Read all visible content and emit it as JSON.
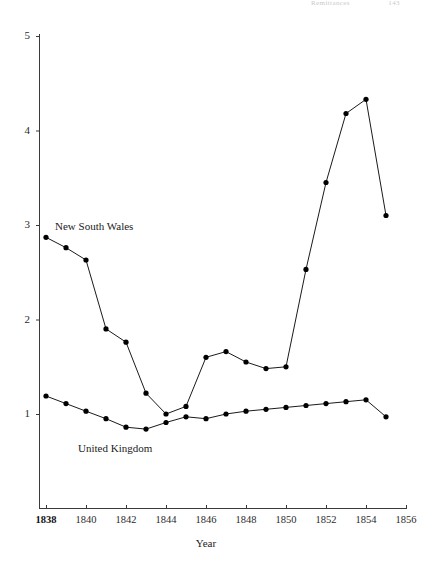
{
  "page_header": {
    "running_head": "Remittances",
    "page_number": "143"
  },
  "chart_data": {
    "type": "line",
    "title": "",
    "xlabel": "Year",
    "ylabel": "",
    "xlim": [
      1838,
      1856
    ],
    "ylim": [
      0.55,
      5
    ],
    "grid": false,
    "legend": "inline-labels",
    "x": [
      1838,
      1839,
      1840,
      1841,
      1842,
      1843,
      1844,
      1845,
      1846,
      1847,
      1848,
      1849,
      1850,
      1851,
      1852,
      1853,
      1854,
      1855
    ],
    "xticks": [
      1838,
      1840,
      1842,
      1844,
      1846,
      1848,
      1850,
      1852,
      1854,
      1856
    ],
    "xtick_labels": [
      "1838",
      "1840",
      "1842",
      "1844",
      "1846",
      "1848",
      "1850",
      "1852",
      "1854",
      "1856"
    ],
    "yticks": [
      1,
      2,
      3,
      4,
      5
    ],
    "ytick_labels": [
      "1",
      "2",
      "3",
      "4",
      "5"
    ],
    "series": [
      {
        "name": "New South Wales",
        "label_position": "inline-upper-left",
        "marker": "filled-circle",
        "color": "#000000",
        "values": [
          2.87,
          2.76,
          2.63,
          1.9,
          1.76,
          1.22,
          1.0,
          1.08,
          1.6,
          1.66,
          1.55,
          1.48,
          1.5,
          2.53,
          3.45,
          4.18,
          4.33,
          3.1
        ]
      },
      {
        "name": "United Kingdom",
        "label_position": "inline-lower-left",
        "marker": "filled-circle",
        "color": "#000000",
        "values": [
          1.19,
          1.11,
          1.03,
          0.95,
          0.86,
          0.84,
          0.91,
          0.97,
          0.95,
          1.0,
          1.03,
          1.05,
          1.07,
          1.09,
          1.11,
          1.13,
          1.15,
          0.97
        ]
      }
    ]
  },
  "axes": {
    "x_tick_count": 10,
    "y_tick_count": 5
  }
}
